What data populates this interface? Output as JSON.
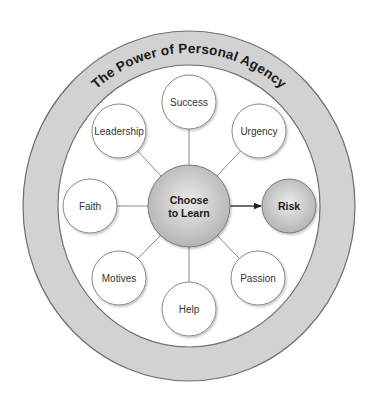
{
  "diagram": {
    "title": "The Power of Personal Agency",
    "colors": {
      "ring_fill": "#d2d2d2",
      "ring_stroke": "#6f6f6f",
      "node_fill": "#ffffff",
      "node_stroke": "#8a8a8a",
      "connector": "#8a8a8a",
      "hub_light": "#ececec",
      "hub_dark": "#b4b4b4",
      "arrow": "#222222"
    },
    "ring": {
      "cx": 189,
      "cy": 206,
      "outer_rx": 166,
      "outer_ry": 175,
      "inner_rx": 131,
      "inner_ry": 141
    },
    "hub": {
      "label_line1": "Choose",
      "label_line2": "to Learn",
      "cx": 189,
      "cy": 206,
      "r": 41
    },
    "target": {
      "label": "Risk",
      "cx": 289,
      "cy": 206,
      "r": 27
    },
    "nodes": [
      {
        "label": "Success",
        "cx": 189,
        "cy": 102,
        "r": 27
      },
      {
        "label": "Urgency",
        "cx": 259,
        "cy": 131,
        "r": 27
      },
      {
        "label": "Passion",
        "cx": 258,
        "cy": 278,
        "r": 27
      },
      {
        "label": "Help",
        "cx": 189,
        "cy": 309,
        "r": 27
      },
      {
        "label": "Motives",
        "cx": 119,
        "cy": 278,
        "r": 27
      },
      {
        "label": "Faith",
        "cx": 90,
        "cy": 206,
        "r": 27
      },
      {
        "label": "Leadership",
        "cx": 119,
        "cy": 131,
        "r": 27
      }
    ]
  }
}
